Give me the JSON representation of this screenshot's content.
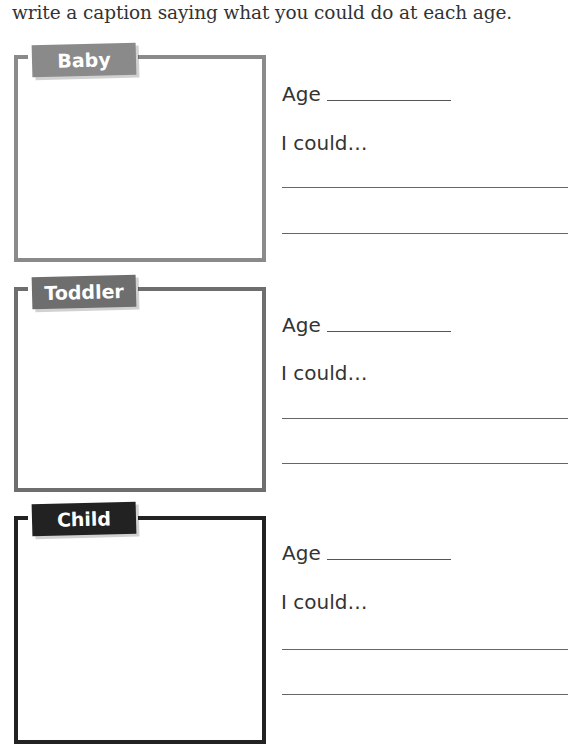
{
  "instruction": "write a caption saying what you could do at each age.",
  "sections": [
    {
      "label": "Baby",
      "color": "#8a8a8a",
      "age_label": "Age",
      "age_value": "",
      "could_label": "I could…",
      "lines": [
        "",
        ""
      ]
    },
    {
      "label": "Toddler",
      "color": "#6e6e6e",
      "age_label": "Age",
      "age_value": "",
      "could_label": "I could…",
      "lines": [
        "",
        ""
      ]
    },
    {
      "label": "Child",
      "color": "#222222",
      "age_label": "Age",
      "age_value": "",
      "could_label": "I could…",
      "lines": [
        "",
        ""
      ]
    }
  ]
}
